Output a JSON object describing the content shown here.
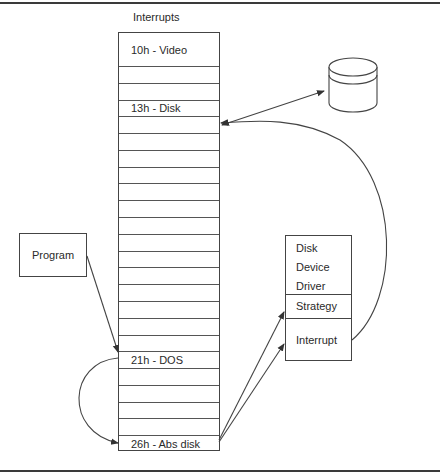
{
  "diagram": {
    "title": "Interrupts",
    "interrupt_table": {
      "row_count": 24,
      "labeled_rows": [
        {
          "index": 0,
          "label": "10h - Video"
        },
        {
          "index": 3,
          "label": "13h - Disk"
        },
        {
          "index": 18,
          "label": "21h - DOS"
        },
        {
          "index": 23,
          "label": "26h - Abs disk"
        }
      ],
      "rows": [
        "10h - Video",
        "",
        "",
        "13h - Disk",
        "",
        "",
        "",
        "",
        "",
        "",
        "",
        "",
        "",
        "",
        "",
        "",
        "",
        "",
        "21h - DOS",
        "",
        "",
        "",
        "",
        "26h - Abs disk"
      ]
    },
    "program_box": {
      "label": "Program"
    },
    "driver_box": {
      "title_lines": [
        "Disk",
        "Device",
        "Driver"
      ],
      "sections": [
        "Strategy",
        "Interrupt"
      ]
    },
    "disk_icon": {
      "name": "disk-cylinder-icon"
    },
    "connections": [
      {
        "from": "Program",
        "to": "21h - DOS",
        "type": "arrow"
      },
      {
        "from": "21h - DOS",
        "to": "26h - Abs disk",
        "type": "curved-arrow"
      },
      {
        "from": "26h - Abs disk",
        "to": "Strategy",
        "type": "arrow"
      },
      {
        "from": "26h - Abs disk",
        "to": "Interrupt",
        "type": "arrow"
      },
      {
        "from": "Interrupt",
        "to": "13h - Disk",
        "type": "curved-arrow"
      },
      {
        "from": "13h - Disk",
        "to": "disk",
        "type": "double-arrow"
      }
    ]
  }
}
